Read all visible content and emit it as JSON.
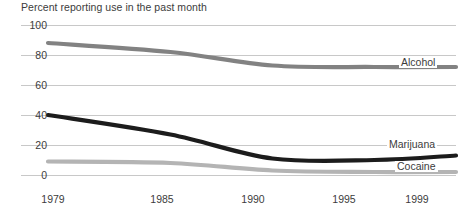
{
  "chart_data": {
    "type": "line",
    "title": "Percent reporting use in the past month",
    "xlabel": "",
    "ylabel": "",
    "x": [
      1979,
      1985,
      1990,
      1995,
      1999
    ],
    "xlim": [
      1979,
      1999
    ],
    "ylim": [
      0,
      100
    ],
    "yticks": [
      0,
      20,
      40,
      60,
      80,
      100
    ],
    "xticks": [
      1979,
      1985,
      1990,
      1995,
      1999
    ],
    "grid": true,
    "legend_position": "right-inline",
    "series": [
      {
        "name": "Alcohol",
        "color": "#828282",
        "values": [
          88,
          82,
          73,
          72,
          72
        ]
      },
      {
        "name": "Marijuana",
        "color": "#1c1c1c",
        "values": [
          40,
          27,
          11,
          10,
          13
        ]
      },
      {
        "name": "Cocaine",
        "color": "#b4b4b4",
        "values": [
          9,
          8,
          3,
          2,
          2
        ]
      }
    ]
  },
  "axis": {
    "y_tick_labels": [
      "100",
      "80",
      "60",
      "40",
      "20",
      "0"
    ],
    "x_tick_labels": [
      "1979",
      "1985",
      "1990",
      "1995",
      "1999"
    ]
  },
  "legend": {
    "alcohol": "Alcohol",
    "marijuana": "Marijuana",
    "cocaine": "Cocaine"
  },
  "colors": {
    "alcohol": "#828282",
    "marijuana": "#1c1c1c",
    "cocaine": "#b4b4b4",
    "gridline": "#c8c8c8",
    "text": "#3c3c3c",
    "background": "#ffffff"
  }
}
